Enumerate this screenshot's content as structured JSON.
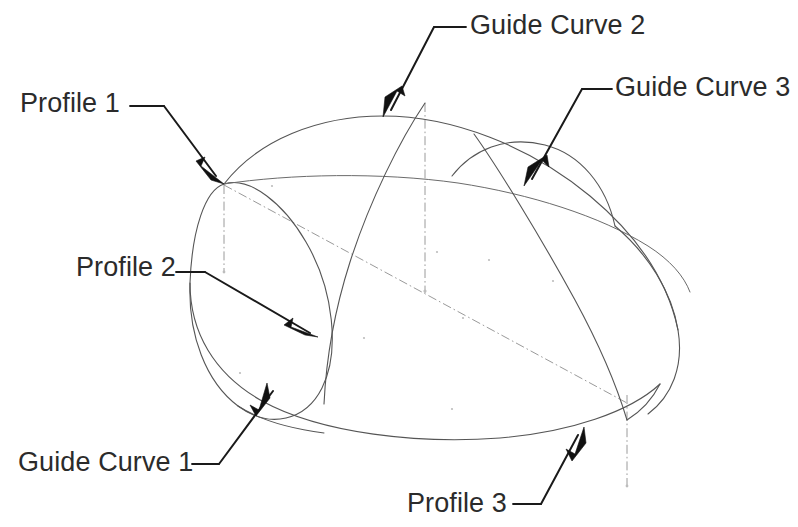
{
  "diagram": {
    "background_color": "#ffffff",
    "line_color": "#555555",
    "leader_color": "#1a1a1a",
    "centerline_color": "#9a9a9a",
    "text_color": "#2b2b2b"
  },
  "labels": [
    {
      "id": "profile-1",
      "text": "Profile 1",
      "x": 20,
      "y": 88,
      "arrow_tip": [
        224,
        184
      ]
    },
    {
      "id": "guide-curve-2",
      "text": "Guide Curve 2",
      "x": 470,
      "y": 10,
      "arrow_tip": [
        383,
        117
      ]
    },
    {
      "id": "guide-curve-3",
      "text": "Guide Curve 3",
      "x": 615,
      "y": 72,
      "arrow_tip": [
        524,
        186
      ]
    },
    {
      "id": "profile-2",
      "text": "Profile 2",
      "x": 76,
      "y": 252,
      "arrow_tip": [
        318,
        337
      ]
    },
    {
      "id": "guide-curve-1",
      "text": "Guide Curve 1",
      "x": 18,
      "y": 447,
      "arrow_tip": [
        267,
        383
      ]
    },
    {
      "id": "profile-3",
      "text": "Profile 3",
      "x": 407,
      "y": 488,
      "arrow_tip": [
        584,
        427
      ]
    }
  ],
  "geometry": {
    "profile_1_ellipse": "left vertical ellipse profile",
    "profile_2_arc": "middle vertical section arc",
    "profile_3_arc": "right vertical section arc",
    "guide_curve_1": "lower outline sweep",
    "guide_curve_2": "upper outline sweep",
    "guide_curve_3": "mid horizon sweep",
    "centerlines": "dash-dot axis lines"
  }
}
